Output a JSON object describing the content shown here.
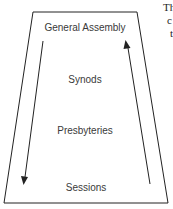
{
  "diagram": {
    "levels": [
      {
        "label": "General Assembly",
        "x": 85,
        "y": 23
      },
      {
        "label": "Synods",
        "x": 85,
        "y": 75
      },
      {
        "label": "Presbyteries",
        "x": 85,
        "y": 126
      },
      {
        "label": "Sessions",
        "x": 86,
        "y": 183
      }
    ],
    "arrows": [
      {
        "name": "left-down-arrow",
        "direction": "down"
      },
      {
        "name": "right-up-arrow",
        "direction": "up"
      }
    ],
    "colors": {
      "line": "#222222",
      "text": "#3a3a3a",
      "background": "#ffffff"
    }
  },
  "side_text": {
    "line1": "Th",
    "line2": "c",
    "line3": "t"
  }
}
